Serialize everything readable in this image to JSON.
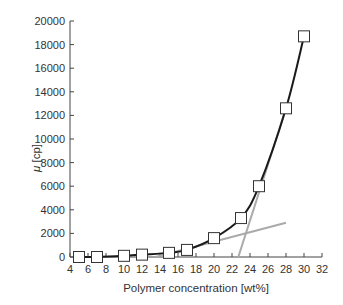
{
  "chart_data": {
    "type": "line",
    "title": "",
    "xlabel": "Polymer concentration [wt%]",
    "ylabel_symbol": "μ",
    "ylabel_unit": " [cp]",
    "xlim": [
      4,
      32
    ],
    "ylim": [
      0,
      20000
    ],
    "xticks": [
      4,
      6,
      8,
      10,
      12,
      14,
      16,
      18,
      20,
      22,
      24,
      26,
      28,
      30,
      32
    ],
    "yticks": [
      0,
      2000,
      4000,
      6000,
      8000,
      10000,
      12000,
      14000,
      16000,
      18000,
      20000
    ],
    "grid": false,
    "legend": null,
    "series": [
      {
        "name": "viscosity",
        "marker": "square",
        "color": "#1a1a1a",
        "x": [
          5,
          7,
          10,
          12,
          15,
          17,
          20,
          23,
          25,
          28,
          30
        ],
        "values": [
          0,
          0,
          100,
          200,
          350,
          600,
          1600,
          3300,
          6000,
          12600,
          18700
        ]
      },
      {
        "name": "tangent-low",
        "marker": "none",
        "color": "#aaaaaa",
        "x": [
          13.5,
          28
        ],
        "values": [
          0,
          2900
        ]
      },
      {
        "name": "tangent-high",
        "marker": "none",
        "color": "#aaaaaa",
        "x": [
          22.7,
          28
        ],
        "values": [
          0,
          12600
        ]
      }
    ]
  }
}
